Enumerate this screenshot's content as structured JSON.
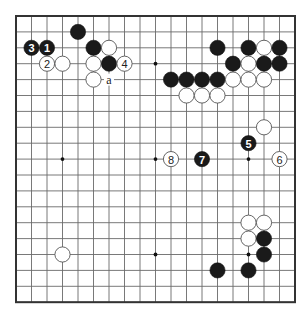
{
  "diagram": {
    "type": "go-board",
    "size": 19,
    "colors": {
      "black": "#1a1a1a",
      "white": "#ffffff",
      "line": "#6a6a6a",
      "border": "#333333"
    },
    "star_points": [
      {
        "c": 3,
        "r": 3
      },
      {
        "c": 9,
        "r": 3
      },
      {
        "c": 15,
        "r": 3
      },
      {
        "c": 3,
        "r": 9
      },
      {
        "c": 9,
        "r": 9
      },
      {
        "c": 15,
        "r": 9
      },
      {
        "c": 3,
        "r": 15
      },
      {
        "c": 9,
        "r": 15
      },
      {
        "c": 15,
        "r": 15
      }
    ],
    "stones": [
      {
        "color": "black",
        "c": 4,
        "r": 1,
        "label": ""
      },
      {
        "color": "black",
        "c": 1,
        "r": 2,
        "label": "3"
      },
      {
        "color": "black",
        "c": 2,
        "r": 2,
        "label": "1"
      },
      {
        "color": "black",
        "c": 5,
        "r": 2,
        "label": ""
      },
      {
        "color": "white",
        "c": 6,
        "r": 2,
        "label": ""
      },
      {
        "color": "white",
        "c": 2,
        "r": 3,
        "label": "2"
      },
      {
        "color": "white",
        "c": 3,
        "r": 3,
        "label": ""
      },
      {
        "color": "white",
        "c": 5,
        "r": 3,
        "label": ""
      },
      {
        "color": "black",
        "c": 6,
        "r": 3,
        "label": ""
      },
      {
        "color": "white",
        "c": 7,
        "r": 3,
        "label": "4"
      },
      {
        "color": "white",
        "c": 5,
        "r": 4,
        "label": ""
      },
      {
        "color": "black",
        "c": 13,
        "r": 2,
        "label": ""
      },
      {
        "color": "black",
        "c": 15,
        "r": 2,
        "label": ""
      },
      {
        "color": "white",
        "c": 16,
        "r": 2,
        "label": ""
      },
      {
        "color": "black",
        "c": 17,
        "r": 2,
        "label": ""
      },
      {
        "color": "black",
        "c": 14,
        "r": 3,
        "label": ""
      },
      {
        "color": "white",
        "c": 15,
        "r": 3,
        "label": ""
      },
      {
        "color": "black",
        "c": 16,
        "r": 3,
        "label": ""
      },
      {
        "color": "black",
        "c": 17,
        "r": 3,
        "label": ""
      },
      {
        "color": "black",
        "c": 10,
        "r": 4,
        "label": ""
      },
      {
        "color": "black",
        "c": 11,
        "r": 4,
        "label": ""
      },
      {
        "color": "black",
        "c": 12,
        "r": 4,
        "label": ""
      },
      {
        "color": "black",
        "c": 13,
        "r": 4,
        "label": ""
      },
      {
        "color": "white",
        "c": 14,
        "r": 4,
        "label": ""
      },
      {
        "color": "white",
        "c": 15,
        "r": 4,
        "label": ""
      },
      {
        "color": "white",
        "c": 16,
        "r": 4,
        "label": ""
      },
      {
        "color": "white",
        "c": 11,
        "r": 5,
        "label": ""
      },
      {
        "color": "white",
        "c": 12,
        "r": 5,
        "label": ""
      },
      {
        "color": "white",
        "c": 13,
        "r": 5,
        "label": ""
      },
      {
        "color": "white",
        "c": 16,
        "r": 7,
        "label": ""
      },
      {
        "color": "black",
        "c": 15,
        "r": 8,
        "label": "5"
      },
      {
        "color": "white",
        "c": 17,
        "r": 9,
        "label": "6"
      },
      {
        "color": "black",
        "c": 12,
        "r": 9,
        "label": "7"
      },
      {
        "color": "white",
        "c": 10,
        "r": 9,
        "label": "8"
      },
      {
        "color": "white",
        "c": 15,
        "r": 13,
        "label": ""
      },
      {
        "color": "white",
        "c": 16,
        "r": 13,
        "label": ""
      },
      {
        "color": "white",
        "c": 15,
        "r": 14,
        "label": ""
      },
      {
        "color": "black",
        "c": 16,
        "r": 14,
        "label": ""
      },
      {
        "color": "black",
        "c": 16,
        "r": 15,
        "label": ""
      },
      {
        "color": "black",
        "c": 13,
        "r": 16,
        "label": ""
      },
      {
        "color": "black",
        "c": 15,
        "r": 16,
        "label": ""
      },
      {
        "color": "white",
        "c": 3,
        "r": 15,
        "label": ""
      }
    ],
    "point_labels": [
      {
        "c": 6,
        "r": 4,
        "label": "a"
      }
    ]
  }
}
